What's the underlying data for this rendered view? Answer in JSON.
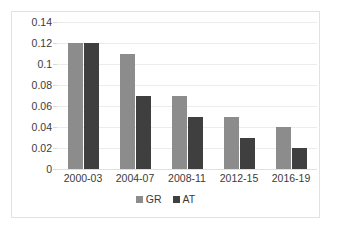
{
  "chart_data": {
    "type": "bar",
    "title": "",
    "subtitle": "",
    "xlabel": "",
    "ylabel": "",
    "categories": [
      "2000-03",
      "2004-07",
      "2008-11",
      "2012-15",
      "2016-19"
    ],
    "series": [
      {
        "name": "GR",
        "color": "#8c8c8c",
        "values": [
          0.12,
          0.11,
          0.07,
          0.05,
          0.04
        ]
      },
      {
        "name": "AT",
        "color": "#3f3f3f",
        "values": [
          0.12,
          0.07,
          0.05,
          0.03,
          0.02
        ]
      }
    ],
    "ylim": [
      0,
      0.14
    ],
    "ytick_values": [
      0.14,
      0.12,
      0.1,
      0.08,
      0.06,
      0.04,
      0.02,
      0
    ],
    "ytick_labels": [
      "0.14",
      "0.12",
      "0.1",
      "0.08",
      "0.06",
      "0.04",
      "0.02",
      "0"
    ],
    "grid": true,
    "grid_axis": "y",
    "legend_position": "bottom",
    "plot_background": "#ffffff",
    "grid_color": "#ececec",
    "border_color": "#e2e2e2",
    "text_color": "#3a3a3a"
  }
}
